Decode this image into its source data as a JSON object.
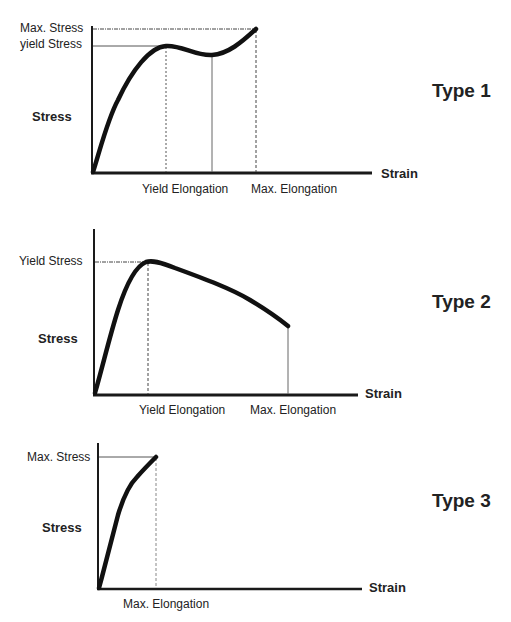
{
  "diagrams": [
    {
      "title": "Type 1",
      "ylabel": "Stress",
      "xlabel": "Strain",
      "y_marks": [
        "Max. Stress",
        "yield Stress"
      ],
      "x_marks": [
        "Yield Elongation",
        "Max. Elongation"
      ]
    },
    {
      "title": "Type 2",
      "ylabel": "Stress",
      "xlabel": "Strain",
      "y_marks": [
        "Yield Stress"
      ],
      "x_marks": [
        "Yield Elongation",
        "Max. Elongation"
      ]
    },
    {
      "title": "Type 3",
      "ylabel": "Stress",
      "xlabel": "Strain",
      "y_marks": [
        "Max. Stress"
      ],
      "x_marks": [
        "Max. Elongation"
      ]
    }
  ],
  "colors": {
    "curve": "#111111",
    "axis": "#1a1a1a",
    "guide": "#444444",
    "background": "#ffffff"
  }
}
